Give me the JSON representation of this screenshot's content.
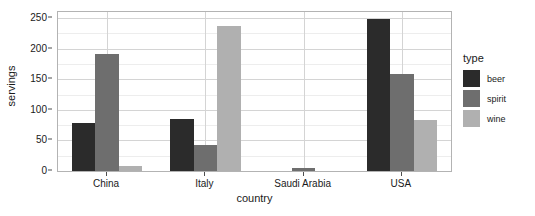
{
  "chart_data": {
    "type": "bar",
    "title": "",
    "xlabel": "country",
    "ylabel": "servings",
    "categories": [
      "China",
      "Italy",
      "Saudi Arabia",
      "USA"
    ],
    "series": [
      {
        "name": "beer",
        "color": "#2b2b2b",
        "values": [
          79,
          85,
          0,
          249
        ]
      },
      {
        "name": "spirit",
        "color": "#6e6e6e",
        "values": [
          192,
          42,
          5,
          158
        ]
      },
      {
        "name": "wine",
        "color": "#b0b0b0",
        "values": [
          8,
          237,
          0,
          84
        ]
      }
    ],
    "ylim": [
      0,
      260
    ],
    "y_ticks": [
      0,
      50,
      100,
      150,
      200,
      250
    ],
    "y_minor_ticks": [
      25,
      75,
      125,
      175,
      225
    ],
    "grid": true,
    "legend": {
      "title": "type",
      "position": "right",
      "entries": [
        "beer",
        "spirit",
        "wine"
      ]
    }
  },
  "panel": {
    "background_color": "#ffffff",
    "border_color": "#b3b3b3",
    "grid_major_color": "#d4d4d4",
    "grid_minor_color": "#ededed"
  }
}
